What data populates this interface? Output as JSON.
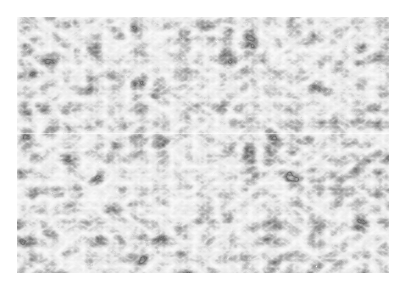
{
  "image": {
    "subject": "grayscale surface texture",
    "description": "Monochrome micrograph-like texture of irregular wavy dark ridges on a light background",
    "colors": {
      "background": "#ffffff",
      "light_tone": "#eeeeee",
      "dark_tone": "#2a2a2a"
    }
  }
}
